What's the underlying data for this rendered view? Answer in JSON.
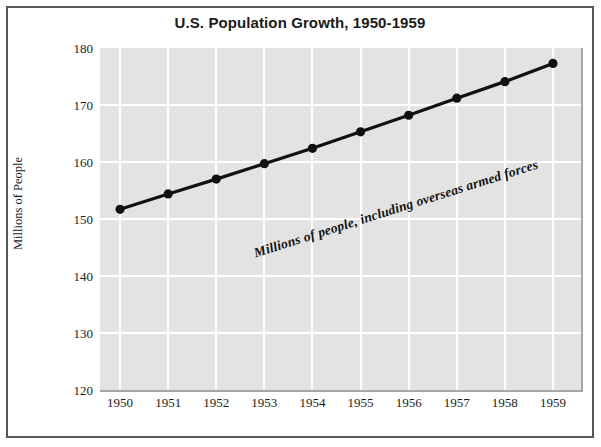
{
  "chart_data": {
    "type": "line",
    "title": "U.S. Population Growth, 1950-1959",
    "xlabel": "",
    "ylabel": "Millions of People",
    "categories": [
      "1950",
      "1951",
      "1952",
      "1953",
      "1954",
      "1955",
      "1956",
      "1957",
      "1958",
      "1959"
    ],
    "values": [
      151.7,
      154.4,
      157.0,
      159.7,
      162.4,
      165.3,
      168.2,
      171.2,
      174.1,
      177.3
    ],
    "series": [
      {
        "name": "U.S. population",
        "values": [
          151.7,
          154.4,
          157.0,
          159.7,
          162.4,
          165.3,
          168.2,
          171.2,
          174.1,
          177.3
        ]
      }
    ],
    "ylim": [
      120,
      180
    ],
    "yticks": [
      "120",
      "130",
      "140",
      "150",
      "160",
      "170",
      "180"
    ],
    "ytick_values": [
      120,
      130,
      140,
      150,
      160,
      170,
      180
    ],
    "grid": true,
    "legend": "none",
    "annotation": "Millions of people, including overseas armed forces",
    "marker": "filled-circle",
    "line_color": "#111111",
    "plot_background": "#e3e3e3",
    "gridline_color": "#ffffff",
    "frame_color": "#58595b"
  },
  "caption_sliver": ""
}
